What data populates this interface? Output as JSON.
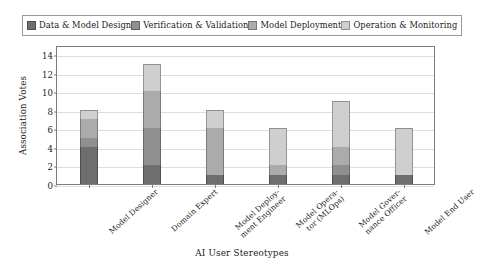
{
  "chart_data": {
    "type": "bar",
    "subtype": "stacked-vertical-bar",
    "title": "",
    "xlabel": "AI User Stereotypes",
    "ylabel": "Association Votes",
    "ylim": [
      0,
      15
    ],
    "yticks": [
      0,
      2,
      4,
      6,
      8,
      10,
      12,
      14
    ],
    "grid": "horizontal",
    "legend_position": "top-outside",
    "categories": [
      "Model Designer",
      "Domain Expert",
      "Model Deployment Engineer",
      "Model Operator (MLOps)",
      "Model Governance Officer",
      "Model End User"
    ],
    "category_labels_wrapped": [
      "Model Designer",
      "Domain Expert",
      "Model Deploy-\nment Engineer",
      "Model Opera-\ntor (MLOps)",
      "Model Gover-\nnance Officer",
      "Model End User"
    ],
    "series": [
      {
        "name": "Data & Model Design",
        "color": "#6e6e6e",
        "values": [
          4,
          2,
          1,
          1,
          1,
          1
        ]
      },
      {
        "name": "Verification & Validation",
        "color": "#8f8f8f",
        "values": [
          1,
          4,
          0,
          0,
          1,
          0
        ]
      },
      {
        "name": "Model Deployment",
        "color": "#ababab",
        "values": [
          2,
          4,
          5,
          1,
          2,
          0
        ]
      },
      {
        "name": "Operation & Monitoring",
        "color": "#cfcfcf",
        "values": [
          1,
          3,
          2,
          4,
          5,
          5
        ]
      }
    ],
    "totals": [
      8,
      13,
      8,
      6,
      9,
      6
    ]
  },
  "legend": {
    "items": [
      {
        "label": "Data & Model Design",
        "color": "#6e6e6e"
      },
      {
        "label": "Verification & Validation",
        "color": "#8f8f8f"
      },
      {
        "label": "Model Deployment",
        "color": "#ababab"
      },
      {
        "label": "Operation & Monitoring",
        "color": "#cfcfcf"
      }
    ]
  },
  "axes": {
    "y_title": "Association Votes",
    "x_title": "AI User Stereotypes",
    "y_tick_labels": [
      "0",
      "2",
      "4",
      "6",
      "8",
      "10",
      "12",
      "14"
    ]
  }
}
